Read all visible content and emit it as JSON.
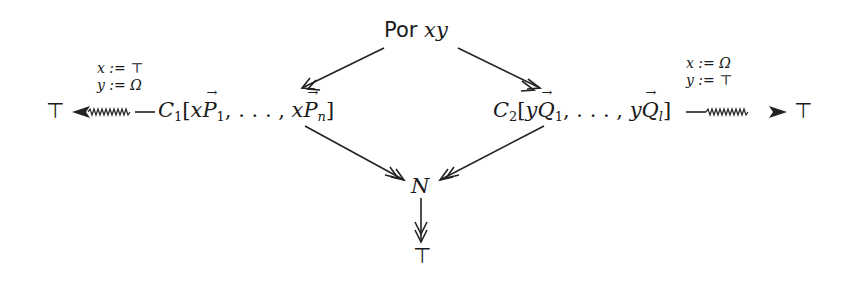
{
  "diagram": {
    "top_node": {
      "prefix": "Por",
      "vars": "xy"
    },
    "left_node": {
      "head": "C",
      "index": "1",
      "arg_var": "x",
      "arg_vec": "P",
      "first_sub": "1",
      "ellipsis": ", . . . , ",
      "last_sub": "n"
    },
    "right_node": {
      "head": "C",
      "index": "2",
      "arg_var": "y",
      "arg_vec": "Q",
      "first_sub": "1",
      "ellipsis": ", . . . , ",
      "last_sub": "l"
    },
    "bottom_node": "N",
    "left_result": "⊤",
    "right_result": "⊤",
    "bottom_result": "⊤",
    "left_label": {
      "line1": "x := ⊤",
      "line2": "y := Ω"
    },
    "right_label": {
      "line1": "x := Ω",
      "line2": "y := ⊤"
    },
    "edges": [
      {
        "from": "Por xy",
        "to": "C1",
        "style": "double-head"
      },
      {
        "from": "Por xy",
        "to": "C2",
        "style": "double-head"
      },
      {
        "from": "C1",
        "to": "N",
        "style": "double-head"
      },
      {
        "from": "C2",
        "to": "N",
        "style": "double-head"
      },
      {
        "from": "N",
        "to": "⊤",
        "style": "double-head"
      },
      {
        "from": "C1",
        "to": "⊤",
        "style": "squiggly"
      },
      {
        "from": "C2",
        "to": "⊤",
        "style": "squiggly"
      }
    ]
  }
}
